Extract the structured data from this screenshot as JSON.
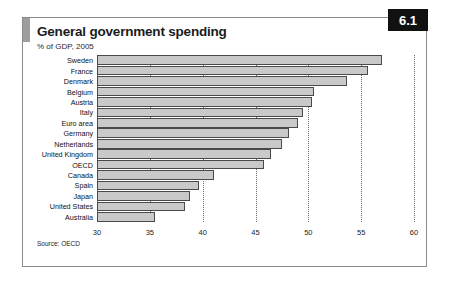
{
  "card": {
    "title": "General government spending",
    "subtitle": "% of GDP, 2005",
    "badge": "6.1",
    "source": "Source: OECD"
  },
  "chart_data": {
    "type": "bar",
    "orientation": "horizontal",
    "title": "General government spending",
    "subtitle": "% of GDP, 2005",
    "xlabel": "",
    "ylabel": "",
    "xlim": [
      30,
      60
    ],
    "xticks": [
      30,
      35,
      40,
      45,
      50,
      55,
      60
    ],
    "xticklabels": [
      "30",
      "35",
      "40",
      "45",
      "50",
      "55",
      "60"
    ],
    "grid": "vertical-dotted",
    "legend": null,
    "source": "Source: OECD",
    "categories": [
      "Sweden",
      "France",
      "Denmark",
      "Belgium",
      "Austria",
      "Italy",
      "Euro area",
      "Germany",
      "Netherlands",
      "United Kingdom",
      "OECD",
      "Canada",
      "Spain",
      "Japan",
      "United States",
      "Australia"
    ],
    "values": [
      57.0,
      55.6,
      53.7,
      50.5,
      50.3,
      49.5,
      49.0,
      48.2,
      47.5,
      46.5,
      45.8,
      41.1,
      39.7,
      38.8,
      38.3,
      35.5
    ],
    "bar_color": "#c9c9c9",
    "bar_edge_color": "#4a4a4a"
  }
}
